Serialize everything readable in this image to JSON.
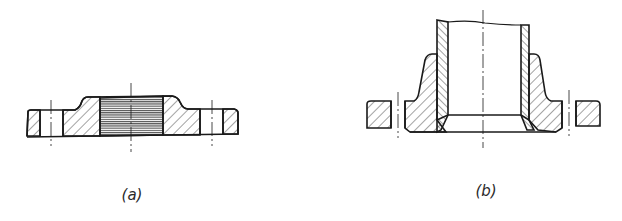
{
  "figure": {
    "panels": [
      {
        "id": "a",
        "caption": "(a)",
        "description": "Threaded flange, cross-section"
      },
      {
        "id": "b",
        "caption": "(b)",
        "description": "Welding-neck flange with pipe, cross-section"
      }
    ],
    "colors": {
      "line": "#1a1a1a",
      "hatch": "#333333",
      "background": "#ffffff"
    }
  }
}
